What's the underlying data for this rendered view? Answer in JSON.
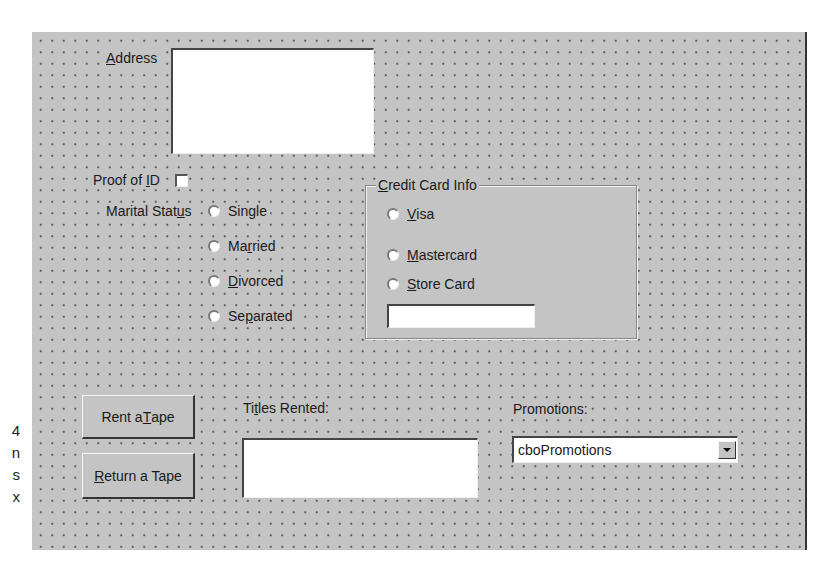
{
  "margin_fragments": [
    "4",
    "n",
    "s",
    "x"
  ],
  "form": {
    "address": {
      "label_pre": "",
      "label_accel": "A",
      "label_post": "ddress",
      "value": ""
    },
    "proof_of_id": {
      "label_pre": "Proof of ",
      "label_accel": "I",
      "label_post": "D",
      "checked": false
    },
    "marital_status": {
      "label_pre": "Marital Stat",
      "label_accel": "u",
      "label_post": "s",
      "options": [
        {
          "pre": "Single",
          "accel": "",
          "post": ""
        },
        {
          "pre": "Ma",
          "accel": "r",
          "post": "ried"
        },
        {
          "pre": "",
          "accel": "D",
          "post": "ivorced"
        },
        {
          "pre": "Se",
          "accel": "p",
          "post": "arated"
        }
      ]
    },
    "credit_card": {
      "title_accel": "C",
      "title_post": "redit Card Info",
      "options": [
        {
          "accel": "V",
          "post": "isa"
        },
        {
          "accel": "M",
          "post": "astercard"
        },
        {
          "accel": "S",
          "post": "tore Card"
        }
      ],
      "number_value": ""
    },
    "buttons": {
      "rent": {
        "pre": "Rent a ",
        "accel": "T",
        "post": "ape"
      },
      "return": {
        "pre": "",
        "accel": "R",
        "post": "eturn a Tape"
      }
    },
    "titles_rented": {
      "label_pre": "Ti",
      "label_accel": "t",
      "label_post": "les Rented:",
      "value": ""
    },
    "promotions": {
      "label": "Promotions:",
      "selected": "cboPromotions"
    }
  }
}
